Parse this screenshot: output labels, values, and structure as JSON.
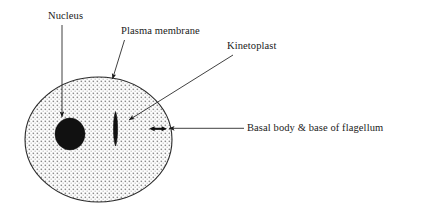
{
  "figure": {
    "kind": "biology-cell-diagram",
    "background_color": "#ffffff",
    "ink_color": "#1a1a1a"
  },
  "labels": {
    "nucleus": "Nucleus",
    "plasma_membrane": "Plasma membrane",
    "kinetoplast": "Kinetoplast",
    "basal_body": "Basal body & base of flagellum"
  },
  "structures": {
    "cell_body": {
      "name": "cell body",
      "shape": "ellipse",
      "fill": "stipple-dot-pattern",
      "stroke": "#1a1a1a",
      "cx": 98.5,
      "cy": 139.5,
      "rx": 73.5,
      "ry": 62.5
    },
    "nucleus": {
      "name": "nucleus",
      "shape": "ellipse",
      "fill": "#111111",
      "cx": 70,
      "cy": 134,
      "rx": 15,
      "ry": 16
    },
    "kinetoplast": {
      "name": "kinetoplast",
      "shape": "vertical-lens",
      "fill": "#111111",
      "cx": 115.5,
      "cy": 128.5,
      "rx": 2.6,
      "ry": 17
    },
    "basal_body": {
      "name": "basal body and base of flagellum",
      "shape": "short-double-headed-arrow",
      "fill": "#111111",
      "x1": 150,
      "x2": 166,
      "y": 129
    }
  },
  "leader_lines": [
    {
      "name": "nucleus-leader",
      "x1": 62,
      "y1": 25,
      "x2": 62,
      "y2": 120,
      "arrow": "end"
    },
    {
      "name": "plasma-membrane-leader",
      "x1": 124,
      "y1": 40,
      "x2": 112,
      "y2": 82,
      "arrow": "end"
    },
    {
      "name": "kinetoplast-leader",
      "x1": 233,
      "y1": 55,
      "x2": 127,
      "y2": 121,
      "arrow": "end"
    },
    {
      "name": "basal-body-leader",
      "x1": 244,
      "y1": 128,
      "x2": 167,
      "y2": 128,
      "arrow": "end"
    }
  ]
}
